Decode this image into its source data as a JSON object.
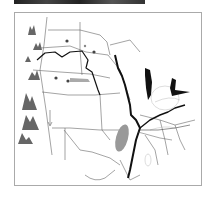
{
  "map": {
    "subject": "Central United States physical map",
    "features": [
      "state-borders",
      "rivers",
      "great-lakes",
      "mountains",
      "cities"
    ],
    "colors": {
      "border": "#555555",
      "river": "#111111",
      "mountain": "#666666",
      "lake": "#111111",
      "highland": "#999999",
      "city": "#444444"
    }
  }
}
